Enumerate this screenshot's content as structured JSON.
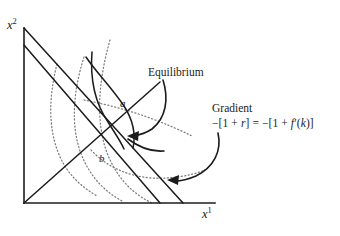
{
  "figure": {
    "domain": "diagram",
    "background_color": "#ffffff",
    "ink_color": "#1b1b1b",
    "dotted_color": "#7d7d7d",
    "width": 340,
    "height": 236
  },
  "axes": {
    "y_label": "x",
    "y_label_sup": "2",
    "x_label": "x",
    "x_label_sup": "1",
    "origin": [
      24,
      203
    ],
    "y_axis_top": [
      24,
      28
    ],
    "x_axis_right": [
      215,
      203
    ]
  },
  "points": [
    {
      "name": "a",
      "label": "a",
      "x": 118,
      "y": 105
    },
    {
      "name": "b",
      "label": "b",
      "x": 97,
      "y": 160
    },
    {
      "name": "equilibrium",
      "label": "",
      "x": 120,
      "y": 136
    }
  ],
  "callouts": [
    {
      "name": "equilibrium",
      "text": "Equilibrium",
      "formula": "",
      "anchor": [
        148,
        66
      ],
      "arrow_tip": [
        128,
        136
      ]
    },
    {
      "name": "gradient",
      "text": "Gradient",
      "formula": "−[1 + r] = −[1 + f′(k)]",
      "formula_parts": {
        "lead": "−[1 + ",
        "var_r": "r",
        "mid": "] = −[1 + ",
        "var_f": "f",
        "prime": "′(",
        "var_k": "k",
        "tail": ")]"
      },
      "anchor": [
        212,
        102
      ],
      "arrow_tip": [
        168,
        180
      ]
    }
  ],
  "curves": {
    "budget_lines": [
      {
        "name": "outer-budget-line",
        "from": [
          24,
          28
        ],
        "to": [
          183,
          203
        ]
      },
      {
        "name": "inner-budget-line",
        "from": [
          24,
          45
        ],
        "to": [
          160,
          203
        ]
      }
    ],
    "production_ray": {
      "name": "production-ray",
      "from": [
        24,
        203
      ],
      "to": [
        160,
        82
      ]
    },
    "solid_production_curves": [
      {
        "name": "production-curve-upper",
        "from": [
          92,
          52
        ],
        "to": [
          118,
          150
        ]
      },
      {
        "name": "production-curve-lower",
        "from": [
          86,
          57
        ],
        "to": [
          133,
          148
        ]
      }
    ],
    "indifference_curves": [
      {
        "name": "indifference-curve-1"
      },
      {
        "name": "indifference-curve-2"
      },
      {
        "name": "indifference-curve-3"
      },
      {
        "name": "indifference-curve-4"
      },
      {
        "name": "budget-dotted-tangent"
      }
    ]
  }
}
